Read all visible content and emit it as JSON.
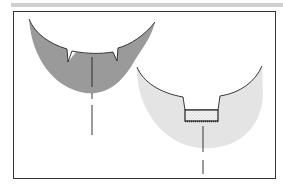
{
  "figure": {
    "panels": [
      {
        "name": "left-section",
        "fill_color": "#9a9a9a",
        "features": [
          "two V-notches",
          "dashed center axis"
        ]
      },
      {
        "name": "right-section",
        "fill_color": "#e4e4e4",
        "features": [
          "rectangular cavity",
          "stippled insert",
          "dashed center axis"
        ]
      }
    ],
    "colors": {
      "frame": "#333333",
      "topbar": "#cfcfcf",
      "dark_fill": "#9a9a9a",
      "light_fill": "#e4e4e4",
      "insert_fill": "#f2f2f2"
    }
  }
}
